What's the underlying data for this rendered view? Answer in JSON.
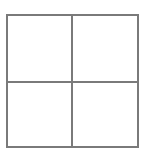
{
  "figure": {
    "title": "",
    "background_color": "#ffffff",
    "line_color": "#7a7a7a",
    "line_width_px": 2,
    "canvas": {
      "width_px": 145,
      "height_px": 154
    },
    "square": {
      "left_px": 6,
      "top_px": 14,
      "width_px": 133,
      "height_px": 134
    },
    "dividers": {
      "vertical_x_px": 72,
      "horizontal_y_px": 82
    },
    "quadrants": [
      {
        "name": "top-left",
        "label": "",
        "fill": "#ffffff"
      },
      {
        "name": "top-right",
        "label": "",
        "fill": "#ffffff"
      },
      {
        "name": "bottom-left",
        "label": "",
        "fill": "#ffffff"
      },
      {
        "name": "bottom-right",
        "label": "",
        "fill": "#ffffff"
      }
    ]
  },
  "chart_data": {
    "type": "diagram",
    "title": "",
    "subtitle": "",
    "xlabel": "",
    "ylabel": "",
    "grid": true,
    "legend": [],
    "annotations": [],
    "shape": "2x2-grid",
    "rows": 2,
    "columns": 2,
    "cell_labels": [
      [
        "",
        ""
      ],
      [
        "",
        ""
      ]
    ]
  }
}
